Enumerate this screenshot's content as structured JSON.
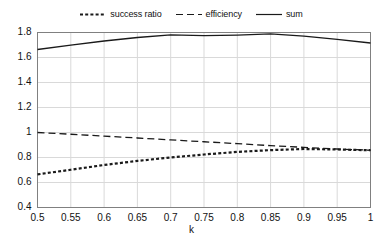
{
  "chart_data": {
    "type": "line",
    "title": "",
    "xlabel": "k",
    "ylabel": "",
    "xlim": [
      0.5,
      1.0
    ],
    "ylim": [
      0.4,
      1.8
    ],
    "grid": true,
    "legend_position": "top",
    "x": [
      0.5,
      0.55,
      0.6,
      0.65,
      0.7,
      0.75,
      0.8,
      0.85,
      0.9,
      0.95,
      1
    ],
    "xtick_labels": [
      "0.5",
      "0.55",
      "0.6",
      "0.65",
      "0.7",
      "0.75",
      "0.8",
      "0.85",
      "0.9",
      "0.95",
      "1"
    ],
    "ytick_labels": [
      "0.4",
      "0.6",
      "0.8",
      "1",
      "1.2",
      "1.4",
      "1.6",
      "1.8"
    ],
    "ytick_values": [
      0.4,
      0.6,
      0.8,
      1.0,
      1.2,
      1.4,
      1.6,
      1.8
    ],
    "series": [
      {
        "name": "success ratio",
        "style": "dotted",
        "color": "#1a1a1a",
        "values": [
          0.665,
          0.702,
          0.74,
          0.773,
          0.8,
          0.824,
          0.845,
          0.859,
          0.868,
          0.864,
          0.858
        ]
      },
      {
        "name": "efficiency",
        "style": "dashed",
        "color": "#1a1a1a",
        "values": [
          1.0,
          0.986,
          0.971,
          0.956,
          0.941,
          0.926,
          0.911,
          0.895,
          0.881,
          0.868,
          0.858
        ]
      },
      {
        "name": "sum",
        "style": "solid",
        "color": "#1a1a1a",
        "values": [
          1.664,
          1.699,
          1.732,
          1.76,
          1.781,
          1.775,
          1.779,
          1.789,
          1.771,
          1.745,
          1.716
        ]
      }
    ]
  },
  "legend": {
    "items": [
      {
        "label": "success ratio",
        "style": "dotted"
      },
      {
        "label": "efficiency",
        "style": "dashed"
      },
      {
        "label": "sum",
        "style": "solid"
      }
    ]
  },
  "axis": {
    "x_title": "k"
  },
  "colors": {
    "ink": "#1a1a1a",
    "gridline": "#d9d9d9",
    "axis": "#808080",
    "background": "#ffffff"
  }
}
